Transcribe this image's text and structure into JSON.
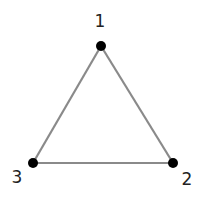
{
  "diagram": {
    "type": "graph",
    "edge_color": "#8a8a8a",
    "node_color": "#000000",
    "nodes": [
      {
        "id": "1",
        "label": "1",
        "x": 101,
        "y": 46,
        "label_x": 100,
        "label_y": 27
      },
      {
        "id": "2",
        "label": "2",
        "x": 173,
        "y": 163,
        "label_x": 187,
        "label_y": 185
      },
      {
        "id": "3",
        "label": "3",
        "x": 33,
        "y": 163,
        "label_x": 17,
        "label_y": 183
      }
    ],
    "edges": [
      {
        "from": "1",
        "to": "2"
      },
      {
        "from": "2",
        "to": "3"
      },
      {
        "from": "3",
        "to": "1"
      }
    ]
  }
}
